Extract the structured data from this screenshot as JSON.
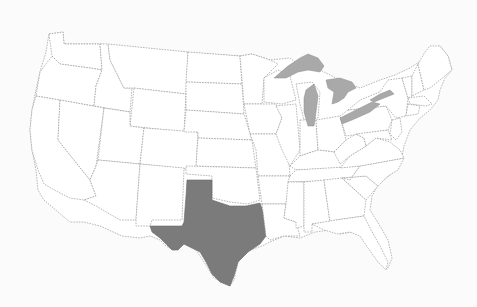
{
  "map": {
    "region": "Contiguous United States",
    "highlighted_state": "Texas",
    "colors": {
      "background": "#fbfbfb",
      "state_fill": "#ffffff",
      "state_border": "#9a9a9a",
      "highlight_fill": "#7b7b7b",
      "lake_fill": "#a9a9a9"
    },
    "features": [
      "state-borders",
      "great-lakes",
      "highlighted-state"
    ]
  }
}
